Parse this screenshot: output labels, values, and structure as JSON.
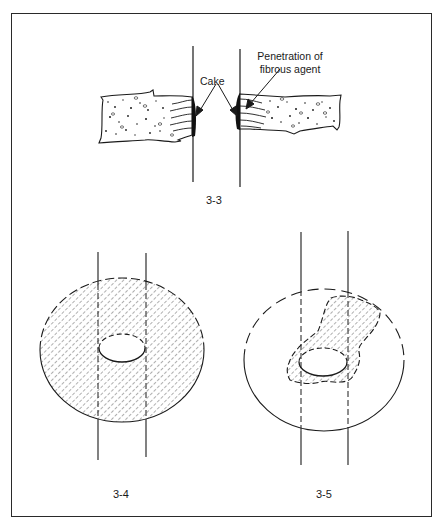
{
  "figures": [
    {
      "id": "3-3",
      "caption": "3-3",
      "annotations": {
        "cake": "Cake",
        "penetration_line1": "Penetration of",
        "penetration_line2": "fibrous agent"
      }
    },
    {
      "id": "3-4",
      "caption": "3-4"
    },
    {
      "id": "3-5",
      "caption": "3-5"
    }
  ],
  "colors": {
    "ink": "#1a1a1a",
    "frame": "#2a2a2a",
    "background": "#ffffff"
  }
}
